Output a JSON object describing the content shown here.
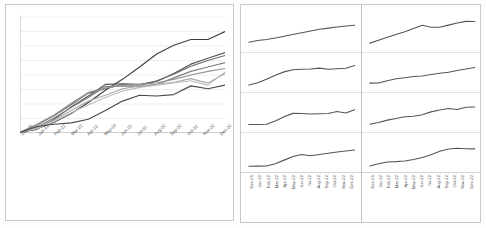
{
  "chart_data": [
    {
      "id": "main-multiline",
      "type": "line",
      "title": "",
      "xlabel": "",
      "ylabel": "",
      "grid": true,
      "legend": "none",
      "ylim": [
        0,
        8
      ],
      "categories": [
        "Dec-21",
        "Jan-22",
        "Feb-22",
        "Mar-22",
        "Apr-22",
        "May-22",
        "Jun-22",
        "Jul-22",
        "Aug-22",
        "Sep-22",
        "Oct-22",
        "Nov-22",
        "Dec-22"
      ],
      "series": [
        {
          "name": "Series 1",
          "color": "#3f3f3f",
          "values": [
            0.05,
            0.3,
            0.75,
            1.35,
            2.1,
            2.95,
            3.7,
            4.55,
            5.45,
            6.05,
            6.45,
            6.45,
            7.0
          ]
        },
        {
          "name": "Series 2",
          "color": "#555555",
          "values": [
            0.05,
            0.25,
            0.95,
            1.8,
            2.55,
            3.35,
            3.4,
            3.35,
            3.55,
            4.1,
            4.75,
            5.15,
            5.55
          ]
        },
        {
          "name": "Series 3",
          "color": "#6b6b6b",
          "values": [
            0.05,
            0.55,
            1.2,
            1.95,
            2.75,
            3.05,
            3.35,
            3.3,
            3.6,
            4.05,
            4.6,
            5.0,
            5.35
          ]
        },
        {
          "name": "Series 4",
          "color": "#7f7f7f",
          "values": [
            0.05,
            0.4,
            1.05,
            1.75,
            2.45,
            3.2,
            3.25,
            3.2,
            3.35,
            3.8,
            4.25,
            4.55,
            4.85
          ]
        },
        {
          "name": "Series 5",
          "color": "#949494",
          "values": [
            0.05,
            0.6,
            1.25,
            2.05,
            2.8,
            3.1,
            3.3,
            3.35,
            3.45,
            3.7,
            4.0,
            4.25,
            4.45
          ]
        },
        {
          "name": "Series 6",
          "color": "#a8a8a8",
          "values": [
            0.05,
            0.35,
            0.9,
            1.55,
            2.2,
            2.6,
            3.05,
            3.25,
            3.35,
            3.5,
            3.75,
            3.45,
            4.1
          ]
        },
        {
          "name": "Series 7",
          "color": "#bdbdbd",
          "values": [
            0.05,
            0.3,
            0.8,
            1.4,
            1.95,
            2.45,
            2.9,
            3.15,
            3.3,
            3.45,
            3.6,
            3.3,
            4.2
          ]
        },
        {
          "name": "Series 8",
          "color": "#4a4a4a",
          "values": [
            0.05,
            0.45,
            0.6,
            0.7,
            0.95,
            1.55,
            2.2,
            2.6,
            2.55,
            2.65,
            3.25,
            3.05,
            3.3
          ]
        }
      ]
    },
    {
      "id": "small-multiple-0-0",
      "type": "line",
      "grid": false,
      "categories": [
        "Dec-21",
        "Jan-22",
        "Feb-22",
        "Mar-22",
        "Apr-22",
        "May-22",
        "Jun-22",
        "Jul-22",
        "Aug-22",
        "Sep-22",
        "Oct-22",
        "Nov-22",
        "Dec-22"
      ],
      "values": [
        1.55,
        2.0,
        2.25,
        2.65,
        3.15,
        3.6,
        4.05,
        4.55,
        5.0,
        5.3,
        5.6,
        5.85,
        6.05
      ],
      "color": "#555555"
    },
    {
      "id": "small-multiple-0-1",
      "type": "line",
      "grid": false,
      "categories": [
        "Dec-21",
        "Jan-22",
        "Feb-22",
        "Mar-22",
        "Apr-22",
        "May-22",
        "Jun-22",
        "Jul-22",
        "Aug-22",
        "Sep-22",
        "Oct-22",
        "Nov-22",
        "Dec-22"
      ],
      "values": [
        1.3,
        2.05,
        2.85,
        3.6,
        4.35,
        5.2,
        6.05,
        5.55,
        5.55,
        6.1,
        6.65,
        7.1,
        7.05
      ],
      "color": "#555555"
    },
    {
      "id": "small-multiple-1-0",
      "type": "line",
      "grid": false,
      "categories": [
        "Dec-21",
        "Jan-22",
        "Feb-22",
        "Mar-22",
        "Apr-22",
        "May-22",
        "Jun-22",
        "Jul-22",
        "Aug-22",
        "Sep-22",
        "Oct-22",
        "Nov-22",
        "Dec-22"
      ],
      "values": [
        0.8,
        1.4,
        2.35,
        3.4,
        4.3,
        4.85,
        5.0,
        5.05,
        5.3,
        5.0,
        5.15,
        5.25,
        6.0
      ],
      "color": "#555555"
    },
    {
      "id": "small-multiple-1-1",
      "type": "line",
      "grid": false,
      "categories": [
        "Dec-21",
        "Jan-22",
        "Feb-22",
        "Mar-22",
        "Apr-22",
        "May-22",
        "Jun-22",
        "Jul-22",
        "Aug-22",
        "Sep-22",
        "Oct-22",
        "Nov-22",
        "Dec-22"
      ],
      "values": [
        1.3,
        1.35,
        1.95,
        2.45,
        2.75,
        3.05,
        3.2,
        3.6,
        3.95,
        4.2,
        4.65,
        5.05,
        5.45
      ],
      "color": "#555555"
    },
    {
      "id": "small-multiple-2-0",
      "type": "line",
      "grid": false,
      "categories": [
        "Dec-21",
        "Jan-22",
        "Feb-22",
        "Mar-22",
        "Apr-22",
        "May-22",
        "Jun-22",
        "Jul-22",
        "Aug-22",
        "Sep-22",
        "Oct-22",
        "Nov-22",
        "Dec-22"
      ],
      "values": [
        0.95,
        0.95,
        1.0,
        1.85,
        3.0,
        3.9,
        3.85,
        3.75,
        3.8,
        3.85,
        4.4,
        4.0,
        4.85
      ],
      "color": "#555555"
    },
    {
      "id": "small-multiple-2-1",
      "type": "line",
      "grid": false,
      "categories": [
        "Dec-21",
        "Jan-22",
        "Feb-22",
        "Mar-22",
        "Apr-22",
        "May-22",
        "Jun-22",
        "Jul-22",
        "Aug-22",
        "Sep-22",
        "Oct-22",
        "Nov-22",
        "Dec-22"
      ],
      "values": [
        1.0,
        1.45,
        2.1,
        2.55,
        3.0,
        3.15,
        3.55,
        4.3,
        4.8,
        5.2,
        4.95,
        5.55,
        5.6
      ],
      "color": "#555555"
    },
    {
      "id": "small-multiple-3-0",
      "type": "line",
      "grid": false,
      "categories": [
        "Dec-21",
        "Jan-22",
        "Feb-22",
        "Mar-22",
        "Apr-22",
        "May-22",
        "Jun-22",
        "Jul-22",
        "Aug-22",
        "Sep-22",
        "Oct-22",
        "Nov-22",
        "Dec-22"
      ],
      "values": [
        0.45,
        0.5,
        0.55,
        1.15,
        2.1,
        3.05,
        3.6,
        3.25,
        3.6,
        3.95,
        4.25,
        4.55,
        4.8
      ],
      "color": "#555555"
    },
    {
      "id": "small-multiple-3-1",
      "type": "line",
      "grid": false,
      "categories": [
        "Dec-21",
        "Jan-22",
        "Feb-22",
        "Mar-22",
        "Apr-22",
        "May-22",
        "Jun-22",
        "Jul-22",
        "Aug-22",
        "Sep-22",
        "Oct-22",
        "Nov-22",
        "Dec-22"
      ],
      "values": [
        0.55,
        1.15,
        1.6,
        1.7,
        1.85,
        2.25,
        2.8,
        3.55,
        4.45,
        5.05,
        5.25,
        5.15,
        5.1
      ],
      "color": "#555555"
    }
  ],
  "left_chart": {
    "xticks": [
      "Dec-21",
      "Jan-22",
      "Feb-22",
      "Mar-22",
      "Apr-22",
      "May-22",
      "Jun-22",
      "Jul-22",
      "Aug-22",
      "Sep-22",
      "Oct-22",
      "Nov-22",
      "Dec-22"
    ],
    "gridline_count": 8
  },
  "right_grid": {
    "rows": 4,
    "columns": 2,
    "xticks": [
      "Dec-21",
      "Jan-22",
      "Feb-22",
      "Mar-22",
      "Apr-22",
      "May-22",
      "Jun-22",
      "Jul-22",
      "Aug-22",
      "Sep-22",
      "Oct-22",
      "Nov-22",
      "Dec-22"
    ]
  },
  "style": {
    "grid_color": "#e8e8e8",
    "border_color": "#c9c9c9",
    "axis_text_color": "#4a4a4a",
    "line_color_default": "#555555"
  }
}
